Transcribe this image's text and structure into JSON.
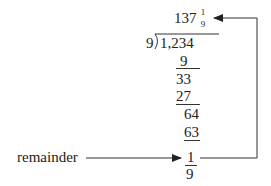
{
  "quotient": {
    "whole": "137",
    "frac_num": "1",
    "frac_den": "9"
  },
  "divisor": "9",
  "dividend": "1,234",
  "steps": [
    {
      "value": "9",
      "underlined": true
    },
    {
      "value": "33",
      "underlined": false
    },
    {
      "value": "27",
      "underlined": true
    },
    {
      "value": "64",
      "underlined": false
    },
    {
      "value": "63",
      "underlined": true
    },
    {
      "value": "1",
      "underlined": true
    },
    {
      "value": "9",
      "underlined": false
    }
  ],
  "labels": {
    "remainder": "remainder"
  },
  "colors": {
    "ink": "#222222",
    "line": "#333333"
  }
}
